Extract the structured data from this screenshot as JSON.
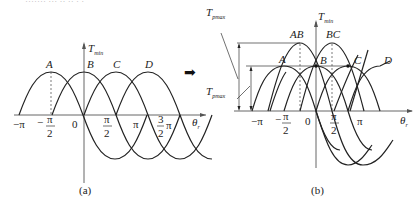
{
  "top_text_cut": "······· ··· ·· ·· · ·",
  "graph_a": {
    "caption": "(a)",
    "y_axis_label": "T",
    "y_axis_sub": "min",
    "x_axis_label": "θ",
    "x_axis_sub": "r",
    "curve_labels": [
      "A",
      "B",
      "C",
      "D"
    ],
    "ticks": {
      "neg_pi": "−π",
      "neg_half_pi_num": "π",
      "neg_half_pi_den": "2",
      "neg_sign": "−",
      "zero": "0",
      "half_pi_num": "π",
      "half_pi_den": "2",
      "pi": "π",
      "three_half_num": "3",
      "three_half_den": "2",
      "three_half_pi": "π"
    }
  },
  "arrow": "➡",
  "graph_b": {
    "caption": "(b)",
    "y_axis_label": "T",
    "y_axis_sub": "min",
    "x_axis_label": "θ",
    "x_axis_sub": "r",
    "curve_labels": [
      "A",
      "B",
      "C",
      "D",
      "AB",
      "BC"
    ],
    "left_label_top": "T",
    "left_label_top_sub": "pmax",
    "left_label_bottom": "T",
    "left_label_bottom_sub": "pmax",
    "ticks": {
      "neg_pi": "−π",
      "neg_half_pi_num": "π",
      "neg_half_pi_den": "2",
      "neg_sign": "−",
      "zero": "0",
      "half_pi_num": "π",
      "half_pi_den": "2",
      "pi": "π"
    }
  }
}
